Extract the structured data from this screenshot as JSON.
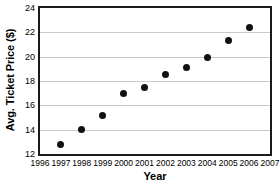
{
  "chart_data": {
    "type": "scatter",
    "title": "",
    "xlabel": "Year",
    "ylabel": "Avg. Ticket Price ($)",
    "x": [
      1997,
      1998,
      1999,
      2000,
      2001,
      2002,
      2003,
      2004,
      2005,
      2006
    ],
    "values": [
      12.8,
      14.0,
      15.2,
      17.0,
      17.5,
      18.5,
      19.1,
      19.9,
      21.35,
      22.4
    ],
    "points": [
      {
        "x": 1997,
        "y": 12.8
      },
      {
        "x": 1998,
        "y": 14.0
      },
      {
        "x": 1999,
        "y": 15.2
      },
      {
        "x": 2000,
        "y": 17.0
      },
      {
        "x": 2001,
        "y": 17.5
      },
      {
        "x": 2002,
        "y": 18.5
      },
      {
        "x": 2003,
        "y": 19.1
      },
      {
        "x": 2004,
        "y": 19.9
      },
      {
        "x": 2005,
        "y": 21.35
      },
      {
        "x": 2006,
        "y": 22.4
      }
    ],
    "xlim": [
      1996,
      2007
    ],
    "ylim": [
      12,
      24
    ],
    "xticks": [
      1996,
      1997,
      1998,
      1999,
      2000,
      2001,
      2002,
      2003,
      2004,
      2005,
      2006,
      2007
    ],
    "xticklabels": [
      "1996",
      "1997",
      "1998",
      "1999",
      "2000",
      "2001",
      "2002",
      "2003",
      "2004",
      "2005",
      "2006",
      "2007"
    ],
    "yticks": [
      12,
      14,
      16,
      18,
      20,
      22,
      24
    ],
    "yticklabels": [
      "12",
      "14",
      "16",
      "18",
      "20",
      "22",
      "24"
    ],
    "grid": "horizontal",
    "legend": "none",
    "marker_color": "#111111",
    "gridline_color": "#c9c9c9",
    "frame_color": "#1a1a1a",
    "background_color": "#ffffff"
  }
}
